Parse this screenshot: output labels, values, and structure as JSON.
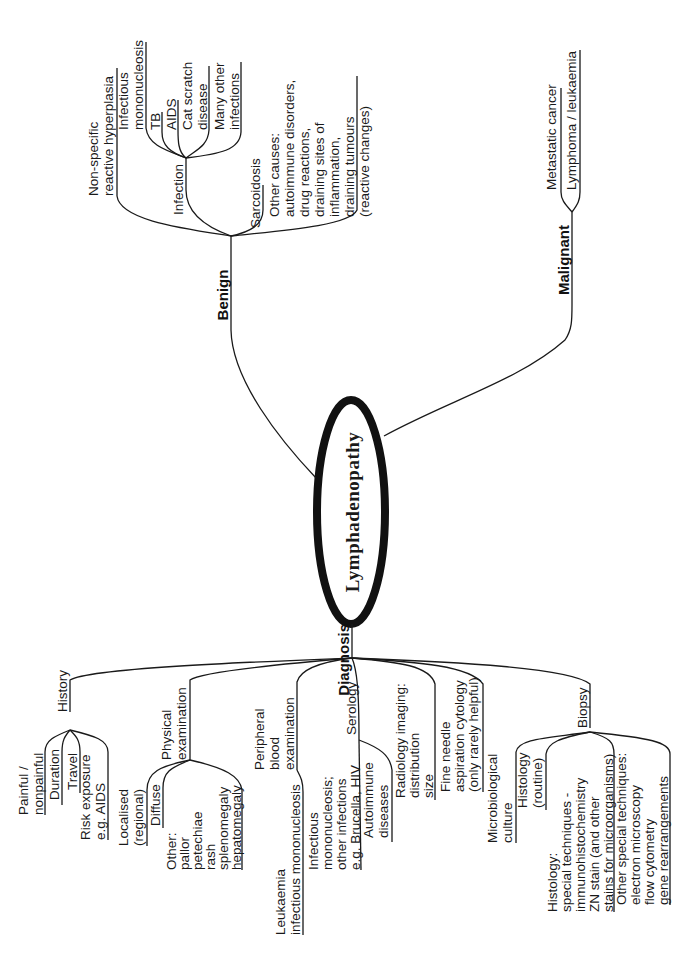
{
  "center": {
    "label": "Lymphadenopathy"
  },
  "branches": {
    "benign": {
      "label": "Benign",
      "items": {
        "nonspecific": [
          "Non-specific",
          "reactive hyperplasia"
        ],
        "infection": {
          "label": "Infection",
          "items": {
            "infectious_mono": [
              "Infectious",
              "mononucleosis"
            ],
            "tb": [
              "TB"
            ],
            "aids": [
              "AIDS"
            ],
            "cat_scratch": [
              "Cat scratch",
              "disease"
            ],
            "many_other": [
              "Many other",
              "infections"
            ]
          }
        },
        "sarcoidosis": [
          "Sarcoidosis"
        ],
        "other_causes": [
          "Other causes:",
          "autoimmune disorders,",
          "drug reactions,",
          "draining sites of",
          "inflammation,",
          "draining tumours",
          "(reactive changes)"
        ]
      }
    },
    "malignant": {
      "label": "Malignant",
      "items": {
        "metastatic": [
          "Metastatic cancer"
        ],
        "lymphoma": [
          "Lymphoma / leukaemia"
        ]
      }
    },
    "diagnosis": {
      "label": "Diagnosis",
      "items": {
        "history": {
          "label": "History",
          "items": {
            "painful": [
              "Painful /",
              "nonpainful"
            ],
            "duration": [
              "Duration"
            ],
            "travel": [
              "Travel"
            ],
            "risk": [
              "Risk exposure",
              "e.g. AIDS"
            ]
          }
        },
        "physical": {
          "label": [
            "Physical",
            "examination"
          ],
          "items": {
            "localised": [
              "Localised",
              "(regional)"
            ],
            "diffuse": [
              "Diffuse"
            ],
            "other": [
              "Other:",
              "pallor",
              "petechiae",
              "rash",
              "splenomegaly",
              "hepatomegaly"
            ]
          }
        },
        "peripheral": {
          "label": [
            "Peripheral",
            "blood",
            "examination"
          ],
          "items": {
            "leukaemia": [
              "Leukaemia",
              "infectious mononucleosis"
            ]
          }
        },
        "serology": {
          "label": "Serology",
          "items": {
            "infectious": [
              "Infectious",
              "mononucleosis;",
              "other infections",
              "e.g. Brucella, HIV"
            ],
            "autoimmune": [
              "Autoimmune",
              "diseases"
            ]
          }
        },
        "radiology": [
          "Radiology imaging:",
          "distribution",
          "size"
        ],
        "fna": [
          "Fine needle",
          "aspiration cytology",
          "(only rarely helpful)"
        ],
        "biopsy": {
          "label": "Biopsy",
          "items": {
            "micro": [
              "Microbiological",
              "culture"
            ],
            "histology_routine": [
              "Histology",
              "(routine)"
            ],
            "histology_special": [
              "Histology:",
              "special techniques -",
              "immunohistochemistry",
              "ZN stain (and other",
              "stains for microorganisms)"
            ],
            "other_special": [
              "Other special techniques:",
              "electron microscopy",
              "flow cytometry",
              "gene rearrangements"
            ]
          }
        }
      }
    }
  }
}
